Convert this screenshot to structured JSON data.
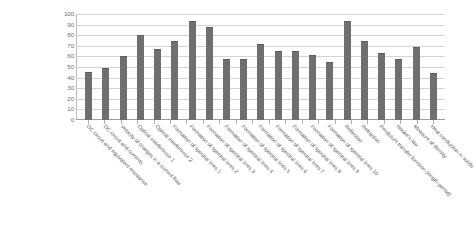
{
  "chart_data": {
    "type": "bar",
    "title": "",
    "xlabel": "",
    "ylabel": "",
    "ylim": [
      0,
      100
    ],
    "ytick_step": 10,
    "yticks": [
      100,
      90,
      80,
      70,
      60,
      50,
      40,
      30,
      20,
      10,
      0
    ],
    "grid": true,
    "legend": false,
    "legend_position": "none",
    "bar_color": "#6f6f6f",
    "gridline_color": "#d4d4d4",
    "axis_color": "#9e9e9e",
    "tick_label_color": "#6e6e6e",
    "category_label_color": "#5c5c5c",
    "category_label_rotation": 45,
    "categories": [
      "DC circuit and equivalent resistance",
      "DC circuit and currents",
      "Velocity of charges in a current flow",
      "Optical interference 1",
      "Optical interference 2",
      "Formation of spectral lines 1",
      "Formation of spectral lines 2",
      "Formation of spectral lines 3",
      "Formation of spectral lines 4",
      "Formation of spectral lines 5",
      "Formation of spectral lines 6",
      "Formation of spectral lines 7",
      "Formation of spectral lines 8",
      "Formation of spectral lines 9",
      "Formation of spectral lines 10",
      "Reflection",
      "Refraction",
      "Pendulum transfer function (length-period)",
      "Hooke's law",
      "Measure of density",
      "Heat conduction in solids"
    ],
    "values": [
      45,
      49,
      60,
      80,
      67,
      75,
      93,
      88,
      58,
      58,
      72,
      65,
      65,
      61,
      55,
      93,
      75,
      63,
      58,
      69,
      44
    ]
  }
}
